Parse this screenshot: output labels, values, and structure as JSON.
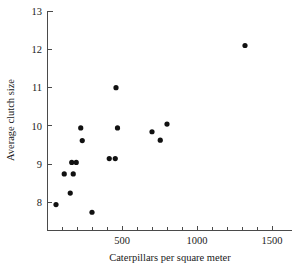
{
  "chart_data": {
    "type": "scatter",
    "title": "",
    "xlabel": "Caterpillars per square meter",
    "ylabel": "Average clutch size",
    "xlim": [
      0,
      1560
    ],
    "ylim": [
      7.35,
      13.0
    ],
    "xticks": [
      0,
      100,
      200,
      300,
      400,
      500,
      600,
      700,
      800,
      900,
      1000,
      1100,
      1200,
      1300,
      1400,
      1500
    ],
    "xtick_labels": [
      "",
      "",
      "",
      "",
      "",
      "500",
      "",
      "",
      "",
      "",
      "1000",
      "",
      "",
      "",
      "",
      "1500"
    ],
    "yticks": [
      8,
      9,
      10,
      11,
      12,
      13
    ],
    "ytick_labels": [
      "8",
      "9",
      "10",
      "11",
      "12",
      "13"
    ],
    "grid": false,
    "legend": false,
    "marker": "filled-circle",
    "marker_color": "#111111",
    "points": [
      {
        "x": 60,
        "y": 7.95
      },
      {
        "x": 115,
        "y": 8.75
      },
      {
        "x": 155,
        "y": 8.25
      },
      {
        "x": 175,
        "y": 8.75
      },
      {
        "x": 165,
        "y": 9.05
      },
      {
        "x": 195,
        "y": 9.05
      },
      {
        "x": 225,
        "y": 9.95
      },
      {
        "x": 235,
        "y": 9.62
      },
      {
        "x": 300,
        "y": 7.75
      },
      {
        "x": 415,
        "y": 9.15
      },
      {
        "x": 455,
        "y": 9.15
      },
      {
        "x": 460,
        "y": 11.0
      },
      {
        "x": 470,
        "y": 9.95
      },
      {
        "x": 700,
        "y": 9.85
      },
      {
        "x": 755,
        "y": 9.63
      },
      {
        "x": 800,
        "y": 10.05
      },
      {
        "x": 1320,
        "y": 12.1
      }
    ]
  },
  "axes": {
    "x_title": "Caterpillars per square meter",
    "y_title": "Average clutch size"
  }
}
